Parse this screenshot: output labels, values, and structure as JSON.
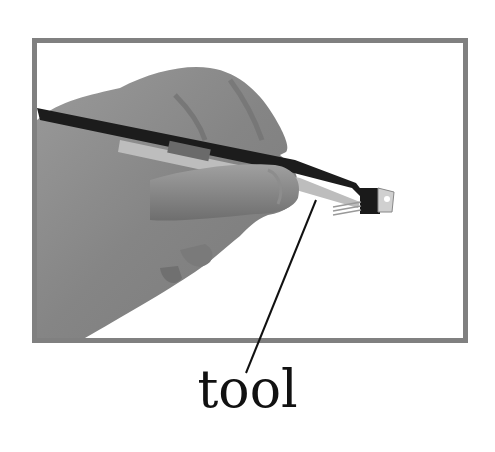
{
  "card": {
    "label": "tool",
    "image_description": "hand holding tweezers gripping a small electronic component",
    "colors": {
      "frame_border": "#808080",
      "background": "#ffffff",
      "label_text": "#111111",
      "leader_line": "#111111"
    }
  }
}
